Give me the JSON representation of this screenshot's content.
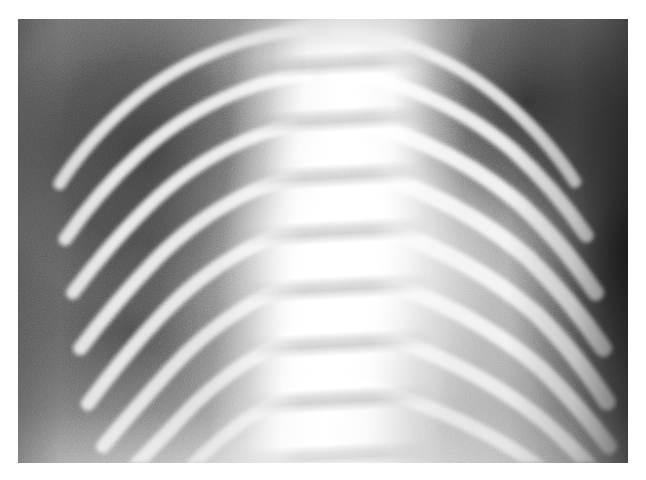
{
  "page": {
    "background_color": "#ffffff",
    "width": 646,
    "height": 480
  },
  "radiograph": {
    "modality": "X-ray",
    "body_part": "chest",
    "view": "AP frontal",
    "subject": "pediatric",
    "caption": "",
    "plate": {
      "left": 18,
      "top": 19,
      "width": 610,
      "height": 444,
      "border_color": "#ffffff"
    },
    "tone": {
      "background_gray": "#8c8c8c",
      "bone_bright": "#f5f5f5",
      "lung_dark": "#3c3c3c",
      "soft_tissue_mid": "#b4b4b4",
      "spine_highlight": "#ffffff",
      "lateral_shadow": "#2b2b2b"
    },
    "anatomy": {
      "spine_label": "thoracic vertebral column",
      "left_hemithorax_label": "right lung field",
      "right_hemithorax_label": "left lung field",
      "rib_count_visible": 9
    },
    "ribs_left": [
      {
        "d": "M 300 12 C 240 18 172 44 118 92 C 86 120 62 150 44 178",
        "w": 13,
        "o": 0.92
      },
      {
        "d": "M 306 60 C 248 66 182 96 128 146 C 96 176 70 208 50 238",
        "w": 14,
        "o": 0.95
      },
      {
        "d": "M 310 112 C 254 118 190 150 138 202 C 106 234 80 266 58 296",
        "w": 14,
        "o": 0.96
      },
      {
        "d": "M 314 166 C 258 174 196 208 146 260 C 114 294 88 326 66 356",
        "w": 15,
        "o": 0.94
      },
      {
        "d": "M 316 222 C 262 232 202 266 154 318 C 122 352 96 386 74 416",
        "w": 15,
        "o": 0.92
      },
      {
        "d": "M 318 278 C 266 290 208 326 162 378 C 132 412 108 440 90 462",
        "w": 15,
        "o": 0.88
      },
      {
        "d": "M 320 334 C 270 348 214 384 170 434 C 146 460 128 478 116 492",
        "w": 15,
        "o": 0.82
      },
      {
        "d": "M 322 392 C 274 406 222 442 182 486",
        "w": 14,
        "o": 0.7
      }
    ],
    "ribs_right": [
      {
        "d": "M 336 10 C 396 16 462 42 516 90 C 548 118 572 148 590 176",
        "w": 13,
        "o": 0.9
      },
      {
        "d": "M 334 58 C 396 62 466 92 524 142 C 556 172 582 204 602 234",
        "w": 15,
        "o": 0.96
      },
      {
        "d": "M 332 108 C 398 114 472 148 532 200 C 566 232 592 266 612 296",
        "w": 17,
        "o": 0.99
      },
      {
        "d": "M 330 158 C 400 168 478 204 540 258 C 574 292 600 326 620 356",
        "w": 18,
        "o": 0.99
      },
      {
        "d": "M 328 212 C 402 224 484 262 548 318 C 582 352 606 386 624 414",
        "w": 18,
        "o": 0.98
      },
      {
        "d": "M 326 268 C 404 282 490 322 554 378 C 586 410 610 440 626 462",
        "w": 17,
        "o": 0.94
      },
      {
        "d": "M 324 326 C 406 342 494 382 558 436 C 586 462 604 480 614 492",
        "w": 16,
        "o": 0.86
      },
      {
        "d": "M 322 386 C 408 402 498 442 560 490",
        "w": 15,
        "o": 0.72
      }
    ]
  }
}
